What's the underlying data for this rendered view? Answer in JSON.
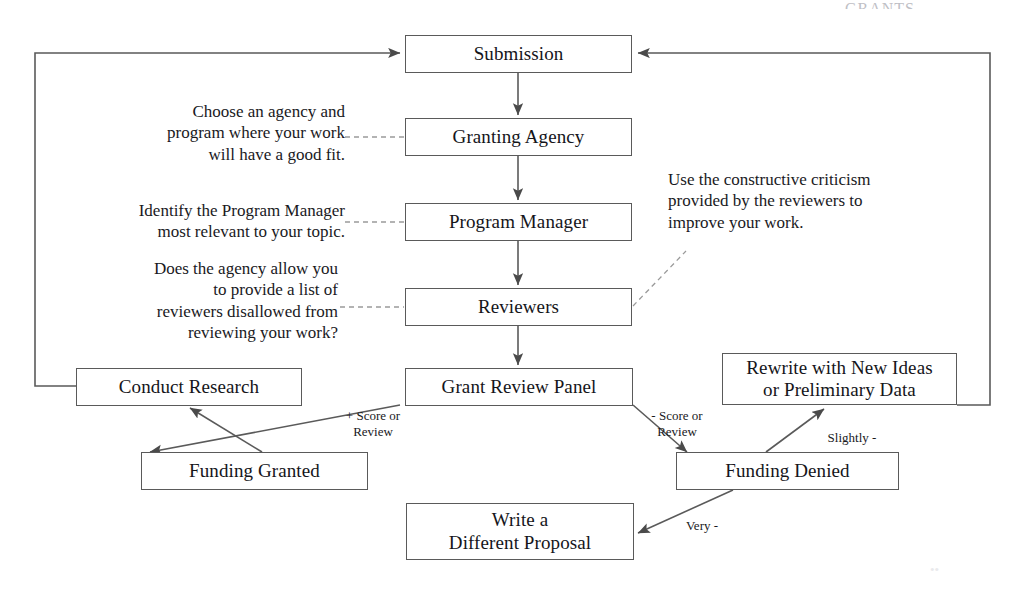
{
  "diagram": {
    "title_clipped": "GRANTS",
    "nodes": [
      {
        "id": "submission",
        "label": "Submission"
      },
      {
        "id": "granting",
        "label": "Granting Agency"
      },
      {
        "id": "program",
        "label": "Program Manager"
      },
      {
        "id": "reviewers",
        "label": "Reviewers"
      },
      {
        "id": "panel",
        "label": "Grant Review Panel"
      },
      {
        "id": "conduct",
        "label": "Conduct Research"
      },
      {
        "id": "granted",
        "label": "Funding Granted"
      },
      {
        "id": "rewrite",
        "label": "Rewrite with New Ideas\nor Preliminary Data"
      },
      {
        "id": "denied",
        "label": "Funding Denied"
      },
      {
        "id": "different",
        "label": "Write a\nDifferent Proposal"
      }
    ],
    "annotations": [
      {
        "id": "annot-granting",
        "text": "Choose an agency and\nprogram where your work\nwill have a good fit."
      },
      {
        "id": "annot-program",
        "text": "Identify the Program Manager\nmost relevant to your topic."
      },
      {
        "id": "annot-reviewers",
        "text": "Does the agency allow you\nto provide a list of\nreviewers disallowed from\nreviewing your work?"
      },
      {
        "id": "annot-criticism",
        "text": "Use the constructive criticism\nprovided by the reviewers to\nimprove your work."
      }
    ],
    "edge_labels": [
      {
        "id": "positive-score",
        "text": "+ Score or\nReview"
      },
      {
        "id": "negative-score",
        "text": "- Score or\nReview"
      },
      {
        "id": "slightly-negative",
        "text": "Slightly -"
      },
      {
        "id": "very-negative",
        "text": "Very -"
      }
    ],
    "colors": {
      "stroke": "#5a5a5a",
      "arrow": "#4a4a4a",
      "dashed": "#8a8a8a",
      "text": "#15151a",
      "background": "#ffffff"
    }
  }
}
